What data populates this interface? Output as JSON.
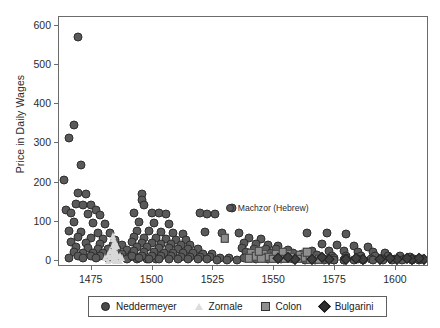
{
  "chart_data": {
    "type": "scatter",
    "title": "",
    "xlabel": "",
    "ylabel": "Price in Daily Wages",
    "xlim": [
      1462,
      1614
    ],
    "ylim": [
      -18,
      620
    ],
    "xticks": [
      1475,
      1500,
      1525,
      1550,
      1575,
      1600
    ],
    "yticks": [
      0,
      100,
      200,
      300,
      400,
      500,
      600
    ],
    "grid": false,
    "legend_position": "below-axes",
    "annotations": [
      {
        "text": "Machzor (Hebrew)",
        "x": 1533,
        "y": 133,
        "marker": "circle"
      }
    ],
    "series": [
      {
        "name": "Neddermeyer",
        "marker": "circle",
        "color": "#5a5a5a",
        "points": [
          [
            1470,
            570
          ],
          [
            1468,
            345
          ],
          [
            1466,
            310
          ],
          [
            1471,
            243
          ],
          [
            1464,
            203
          ],
          [
            1470,
            172
          ],
          [
            1473,
            168
          ],
          [
            1469,
            142
          ],
          [
            1472,
            141
          ],
          [
            1475,
            140
          ],
          [
            1465,
            128
          ],
          [
            1477,
            127
          ],
          [
            1467,
            120
          ],
          [
            1474,
            118
          ],
          [
            1479,
            115
          ],
          [
            1468,
            97
          ],
          [
            1476,
            95
          ],
          [
            1481,
            93
          ],
          [
            1466,
            75
          ],
          [
            1471,
            72
          ],
          [
            1478,
            70
          ],
          [
            1483,
            68
          ],
          [
            1470,
            58
          ],
          [
            1475,
            56
          ],
          [
            1480,
            54
          ],
          [
            1485,
            52
          ],
          [
            1467,
            45
          ],
          [
            1473,
            43
          ],
          [
            1479,
            41
          ],
          [
            1484,
            39
          ],
          [
            1488,
            38
          ],
          [
            1469,
            32
          ],
          [
            1474,
            30
          ],
          [
            1478,
            29
          ],
          [
            1482,
            28
          ],
          [
            1486,
            27
          ],
          [
            1490,
            26
          ],
          [
            1468,
            20
          ],
          [
            1472,
            19
          ],
          [
            1476,
            18
          ],
          [
            1480,
            17
          ],
          [
            1484,
            16
          ],
          [
            1488,
            15
          ],
          [
            1492,
            14
          ],
          [
            1470,
            10
          ],
          [
            1475,
            9
          ],
          [
            1479,
            9
          ],
          [
            1483,
            8
          ],
          [
            1487,
            8
          ],
          [
            1491,
            7
          ],
          [
            1495,
            7
          ],
          [
            1466,
            5
          ],
          [
            1472,
            5
          ],
          [
            1477,
            4
          ],
          [
            1482,
            4
          ],
          [
            1486,
            3
          ],
          [
            1490,
            3
          ],
          [
            1494,
            3
          ],
          [
            1498,
            2
          ],
          [
            1502,
            2
          ],
          [
            1496,
            168
          ],
          [
            1496,
            152
          ],
          [
            1497,
            140
          ],
          [
            1493,
            120
          ],
          [
            1500,
            120
          ],
          [
            1503,
            119
          ],
          [
            1506,
            118
          ],
          [
            1495,
            97
          ],
          [
            1501,
            95
          ],
          [
            1507,
            93
          ],
          [
            1494,
            75
          ],
          [
            1499,
            73
          ],
          [
            1504,
            71
          ],
          [
            1509,
            69
          ],
          [
            1513,
            67
          ],
          [
            1493,
            58
          ],
          [
            1497,
            56
          ],
          [
            1502,
            55
          ],
          [
            1506,
            53
          ],
          [
            1510,
            51
          ],
          [
            1514,
            50
          ],
          [
            1492,
            45
          ],
          [
            1496,
            43
          ],
          [
            1500,
            42
          ],
          [
            1504,
            41
          ],
          [
            1508,
            40
          ],
          [
            1512,
            39
          ],
          [
            1516,
            38
          ],
          [
            1494,
            33
          ],
          [
            1498,
            32
          ],
          [
            1503,
            31
          ],
          [
            1507,
            30
          ],
          [
            1511,
            29
          ],
          [
            1515,
            28
          ],
          [
            1519,
            27
          ],
          [
            1493,
            22
          ],
          [
            1497,
            21
          ],
          [
            1501,
            20
          ],
          [
            1505,
            19
          ],
          [
            1509,
            19
          ],
          [
            1513,
            18
          ],
          [
            1517,
            17
          ],
          [
            1521,
            16
          ],
          [
            1525,
            16
          ],
          [
            1492,
            11
          ],
          [
            1496,
            10
          ],
          [
            1500,
            10
          ],
          [
            1504,
            9
          ],
          [
            1508,
            9
          ],
          [
            1512,
            8
          ],
          [
            1516,
            8
          ],
          [
            1520,
            7
          ],
          [
            1524,
            7
          ],
          [
            1528,
            6
          ],
          [
            1532,
            6
          ],
          [
            1495,
            4
          ],
          [
            1499,
            3
          ],
          [
            1503,
            3
          ],
          [
            1507,
            3
          ],
          [
            1511,
            2
          ],
          [
            1515,
            2
          ],
          [
            1519,
            2
          ],
          [
            1523,
            2
          ],
          [
            1527,
            1
          ],
          [
            1531,
            1
          ],
          [
            1535,
            1
          ],
          [
            1533,
            133
          ],
          [
            1520,
            120
          ],
          [
            1523,
            118
          ],
          [
            1526,
            116
          ],
          [
            1522,
            72
          ],
          [
            1529,
            70
          ],
          [
            1536,
            68
          ],
          [
            1540,
            55
          ],
          [
            1545,
            53
          ],
          [
            1538,
            42
          ],
          [
            1543,
            40
          ],
          [
            1548,
            38
          ],
          [
            1552,
            36
          ],
          [
            1537,
            30
          ],
          [
            1542,
            29
          ],
          [
            1547,
            28
          ],
          [
            1551,
            27
          ],
          [
            1556,
            26
          ],
          [
            1539,
            20
          ],
          [
            1544,
            19
          ],
          [
            1549,
            18
          ],
          [
            1553,
            18
          ],
          [
            1558,
            17
          ],
          [
            1562,
            16
          ],
          [
            1540,
            11
          ],
          [
            1545,
            10
          ],
          [
            1550,
            10
          ],
          [
            1555,
            9
          ],
          [
            1560,
            9
          ],
          [
            1564,
            8
          ],
          [
            1568,
            8
          ],
          [
            1538,
            4
          ],
          [
            1543,
            3
          ],
          [
            1548,
            3
          ],
          [
            1553,
            3
          ],
          [
            1558,
            2
          ],
          [
            1563,
            2
          ],
          [
            1567,
            2
          ],
          [
            1571,
            2
          ],
          [
            1575,
            1
          ],
          [
            1579,
            1
          ],
          [
            1564,
            70
          ],
          [
            1572,
            68
          ],
          [
            1580,
            66
          ],
          [
            1570,
            40
          ],
          [
            1576,
            38
          ],
          [
            1583,
            36
          ],
          [
            1589,
            34
          ],
          [
            1566,
            24
          ],
          [
            1573,
            23
          ],
          [
            1579,
            22
          ],
          [
            1585,
            21
          ],
          [
            1591,
            20
          ],
          [
            1596,
            19
          ],
          [
            1568,
            12
          ],
          [
            1574,
            11
          ],
          [
            1580,
            11
          ],
          [
            1586,
            10
          ],
          [
            1592,
            10
          ],
          [
            1597,
            9
          ],
          [
            1602,
            9
          ],
          [
            1606,
            8
          ],
          [
            1565,
            5
          ],
          [
            1570,
            4
          ],
          [
            1575,
            4
          ],
          [
            1580,
            4
          ],
          [
            1585,
            3
          ],
          [
            1590,
            3
          ],
          [
            1595,
            3
          ],
          [
            1600,
            3
          ],
          [
            1604,
            2
          ],
          [
            1608,
            2
          ],
          [
            1611,
            2
          ],
          [
            1563,
            1
          ],
          [
            1567,
            1
          ],
          [
            1571,
            1
          ],
          [
            1575,
            1
          ],
          [
            1579,
            1
          ],
          [
            1583,
            1
          ],
          [
            1587,
            1
          ],
          [
            1591,
            1
          ],
          [
            1595,
            1
          ],
          [
            1599,
            1
          ],
          [
            1603,
            1
          ],
          [
            1607,
            1
          ],
          [
            1610,
            1
          ]
        ]
      },
      {
        "name": "Zornale",
        "marker": "triangle",
        "color": "#d8d8d8",
        "points": [
          [
            1484,
            66
          ],
          [
            1484,
            58
          ],
          [
            1485,
            50
          ],
          [
            1484,
            44
          ],
          [
            1485,
            38
          ],
          [
            1484,
            32
          ],
          [
            1485,
            27
          ],
          [
            1484,
            22
          ],
          [
            1485,
            18
          ],
          [
            1484,
            14
          ],
          [
            1485,
            11
          ],
          [
            1484,
            8
          ],
          [
            1485,
            6
          ],
          [
            1484,
            4
          ],
          [
            1485,
            2
          ],
          [
            1486,
            40
          ],
          [
            1483,
            28
          ],
          [
            1486,
            20
          ],
          [
            1483,
            12
          ],
          [
            1486,
            6
          ],
          [
            1487,
            14
          ],
          [
            1482,
            18
          ],
          [
            1487,
            3
          ],
          [
            1482,
            3
          ],
          [
            1488,
            9
          ],
          [
            1481,
            9
          ]
        ]
      },
      {
        "name": "Colon",
        "marker": "square",
        "color": "#8e8e8e",
        "points": [
          [
            1530,
            55
          ],
          [
            1541,
            18
          ],
          [
            1546,
            16
          ],
          [
            1551,
            15
          ],
          [
            1556,
            14
          ],
          [
            1561,
            13
          ],
          [
            1543,
            9
          ],
          [
            1548,
            8
          ],
          [
            1553,
            8
          ],
          [
            1558,
            7
          ],
          [
            1563,
            7
          ],
          [
            1567,
            6
          ],
          [
            1540,
            4
          ],
          [
            1545,
            4
          ],
          [
            1550,
            3
          ],
          [
            1555,
            3
          ],
          [
            1560,
            3
          ],
          [
            1565,
            2
          ],
          [
            1569,
            2
          ],
          [
            1544,
            22
          ],
          [
            1554,
            21
          ],
          [
            1564,
            20
          ]
        ]
      },
      {
        "name": "Bulgarini",
        "marker": "diamond",
        "color": "#3f3f3f",
        "points": [
          [
            1552,
            4
          ],
          [
            1559,
            3
          ],
          [
            1566,
            3
          ],
          [
            1573,
            3
          ],
          [
            1580,
            2
          ],
          [
            1587,
            2
          ],
          [
            1594,
            2
          ],
          [
            1601,
            2
          ],
          [
            1607,
            2
          ],
          [
            1612,
            3
          ],
          [
            1556,
            8
          ],
          [
            1570,
            7
          ],
          [
            1584,
            6
          ],
          [
            1598,
            5
          ],
          [
            1605,
            4
          ],
          [
            1610,
            6
          ]
        ]
      }
    ]
  },
  "axes": {
    "ylabel": "Price in Daily Wages",
    "xticklabels": [
      "1475",
      "1500",
      "1525",
      "1550",
      "1575",
      "1600"
    ],
    "yticklabels": [
      "0",
      "100",
      "200",
      "300",
      "400",
      "500",
      "600"
    ]
  },
  "annotation": {
    "label": "Machzor (Hebrew)"
  },
  "legend": {
    "items": [
      {
        "label": "Neddermeyer",
        "marker": "circle"
      },
      {
        "label": "Zornale",
        "marker": "triangle"
      },
      {
        "label": "Colon",
        "marker": "square"
      },
      {
        "label": "Bulgarini",
        "marker": "diamond"
      }
    ]
  }
}
